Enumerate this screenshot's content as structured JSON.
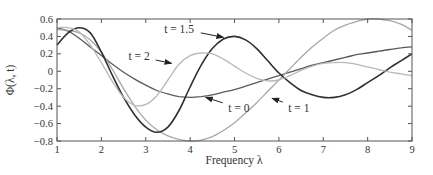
{
  "chart_data": {
    "type": "line",
    "title": "",
    "xlabel": "Frequency λ",
    "ylabel": "Φ(λ, t)",
    "xlim": [
      1,
      9
    ],
    "ylim": [
      -0.8,
      0.6
    ],
    "xticks": [
      1,
      2,
      3,
      4,
      5,
      6,
      7,
      8,
      9
    ],
    "xtick_labels": [
      "1",
      "2",
      "3",
      "4",
      "5",
      "6",
      "7",
      "8",
      "9"
    ],
    "yticks": [
      0.6,
      0.4,
      0.2,
      0,
      -0.2,
      -0.4,
      -0.6,
      -0.8
    ],
    "ytick_labels": [
      "0.6",
      "0.4",
      "0.2",
      "0",
      "−0.2",
      "−0.4",
      "−0.6",
      "−0.8"
    ],
    "grid": false,
    "legend": "none (inline arrow annotations)",
    "x": [
      1,
      1.25,
      1.5,
      1.75,
      2,
      2.25,
      2.5,
      2.75,
      3,
      3.25,
      3.5,
      3.75,
      4,
      4.25,
      4.5,
      4.75,
      5,
      5.25,
      5.5,
      5.75,
      6,
      6.25,
      6.5,
      6.75,
      7,
      7.25,
      7.5,
      7.75,
      8,
      8.25,
      8.5,
      8.75,
      9
    ],
    "series": [
      {
        "name": "t = 0",
        "color": "#5a5a5a",
        "values": [
          0.5,
          0.46,
          0.38,
          0.28,
          0.18,
          0.08,
          -0.01,
          -0.09,
          -0.16,
          -0.22,
          -0.26,
          -0.29,
          -0.3,
          -0.29,
          -0.27,
          -0.24,
          -0.21,
          -0.17,
          -0.13,
          -0.09,
          -0.05,
          -0.01,
          0.03,
          0.07,
          0.1,
          0.13,
          0.16,
          0.19,
          0.21,
          0.23,
          0.25,
          0.27,
          0.28
        ]
      },
      {
        "name": "t = 1",
        "color": "#a8a8a8",
        "values": [
          0.48,
          0.47,
          0.44,
          0.36,
          0.22,
          0.02,
          -0.2,
          -0.4,
          -0.56,
          -0.67,
          -0.74,
          -0.78,
          -0.8,
          -0.79,
          -0.75,
          -0.68,
          -0.59,
          -0.48,
          -0.36,
          -0.23,
          -0.1,
          0.03,
          0.16,
          0.28,
          0.38,
          0.47,
          0.53,
          0.57,
          0.6,
          0.6,
          0.58,
          0.54,
          0.47
        ]
      },
      {
        "name": "t = 1.5",
        "color": "#303030",
        "values": [
          0.3,
          0.44,
          0.5,
          0.44,
          0.22,
          -0.05,
          -0.3,
          -0.5,
          -0.64,
          -0.7,
          -0.64,
          -0.45,
          -0.18,
          0.07,
          0.26,
          0.37,
          0.4,
          0.36,
          0.26,
          0.12,
          -0.02,
          -0.13,
          -0.22,
          -0.27,
          -0.3,
          -0.3,
          -0.27,
          -0.21,
          -0.13,
          -0.05,
          0.04,
          0.12,
          0.2
        ]
      },
      {
        "name": "t = 2",
        "color": "#b8b8b8",
        "values": [
          0.5,
          0.5,
          0.45,
          0.3,
          0.1,
          -0.12,
          -0.3,
          -0.39,
          -0.38,
          -0.28,
          -0.1,
          0.08,
          0.18,
          0.21,
          0.2,
          0.14,
          0.06,
          -0.02,
          -0.08,
          -0.11,
          -0.1,
          -0.05,
          0.01,
          0.06,
          0.09,
          0.1,
          0.1,
          0.08,
          0.05,
          0.02,
          -0.01,
          -0.03,
          -0.05
        ]
      }
    ],
    "annotations": [
      {
        "text": "t = 2",
        "label_x": 2.85,
        "label_y": 0.17,
        "arrow_to_x": 3.58,
        "arrow_to_y": 0.09
      },
      {
        "text": "t = 1.5",
        "label_x": 3.75,
        "label_y": 0.49,
        "arrow_to_x": 4.75,
        "arrow_to_y": 0.39
      },
      {
        "text": "t = 0",
        "label_x": 5.1,
        "label_y": -0.42,
        "arrow_to_x": 4.35,
        "arrow_to_y": -0.3
      },
      {
        "text": "t = 1",
        "label_x": 6.45,
        "label_y": -0.42,
        "arrow_to_x": 5.85,
        "arrow_to_y": -0.31
      }
    ]
  }
}
